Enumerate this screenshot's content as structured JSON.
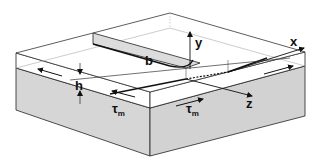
{
  "diagram": {
    "labels": {
      "x_axis": "x",
      "y_axis": "y",
      "z_axis": "z",
      "thickness": "h",
      "width": "b",
      "shear_stress_left": "τ",
      "shear_stress_left_sub": "m",
      "shear_stress_right": "τ",
      "shear_stress_right_sub": "m"
    },
    "colors": {
      "substrate_fill": "#d6d6d6",
      "film_fill": "#ffffff",
      "strip_fill": "#dcdcdc",
      "line": "#222222",
      "light_line": "#9a9a9a"
    }
  }
}
